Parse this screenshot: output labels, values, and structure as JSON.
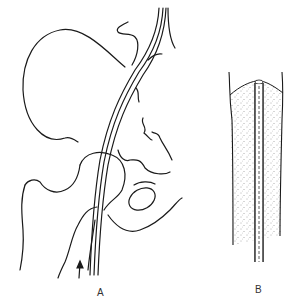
{
  "figure": {
    "panels": [
      {
        "id": "A",
        "label": "A",
        "subject": "hip-joint-with-catheter"
      },
      {
        "id": "B",
        "label": "B",
        "subject": "catheter-in-stippled-tissue-section"
      }
    ],
    "caption_partial": "……",
    "colors": {
      "ink": "#1a1a1a",
      "background": "#ffffff"
    }
  }
}
